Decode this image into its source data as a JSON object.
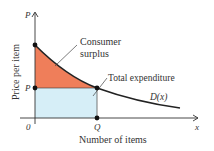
{
  "diagram": {
    "y_axis": {
      "symbol": "P",
      "label": "Price per item"
    },
    "x_axis": {
      "symbol": "x",
      "label": "Number of items"
    },
    "origin_label": "0",
    "price_tick": "P",
    "quantity_tick": "Q",
    "curve_label": "D(x)",
    "regions": [
      {
        "name": "consumer-surplus",
        "label_line1": "Consumer",
        "label_line2": "surplus",
        "color": "#ef7e5a"
      },
      {
        "name": "total-expenditure",
        "label": "Total expenditure",
        "color": "#d6eef7"
      }
    ],
    "colors": {
      "axis": "#333333",
      "curve": "#222222",
      "surplus_fill": "#ef7e5a",
      "expenditure_fill": "#d6eef7",
      "point": "#111111"
    }
  }
}
